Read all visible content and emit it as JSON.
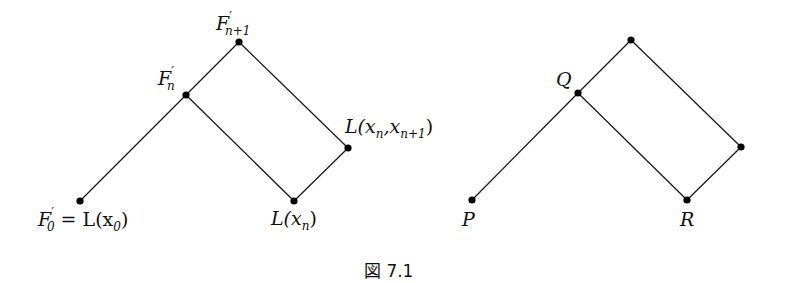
{
  "figure": {
    "caption": "図 7.1",
    "left_diagram": {
      "nodes": [
        {
          "id": "F0",
          "label_main": "F",
          "label_prime": "′",
          "label_sub": "0",
          "label_rest": " = L(x",
          "label_rest_sub": "0",
          "label_close": ")",
          "x": 80,
          "y": 201
        },
        {
          "id": "Fn",
          "label_main": "F",
          "label_prime": "′",
          "label_sub": "n",
          "x": 186,
          "y": 95
        },
        {
          "id": "Fn1",
          "label_main": "F",
          "label_prime": "′",
          "label_sub": "n+1",
          "x": 239,
          "y": 42
        },
        {
          "id": "Lxn",
          "label_main": "L(x",
          "label_sub": "n",
          "label_close": ")",
          "x": 294,
          "y": 201
        },
        {
          "id": "Lxnxn1",
          "label_main": "L(x",
          "label_sub": "n",
          "label_mid": ",x",
          "label_sub2": "n+1",
          "label_close": ")",
          "x": 348,
          "y": 148
        }
      ],
      "edges": [
        [
          "F0",
          "Fn"
        ],
        [
          "Fn",
          "Fn1"
        ],
        [
          "Fn",
          "Lxn"
        ],
        [
          "Fn1",
          "Lxnxn1"
        ],
        [
          "Lxn",
          "Lxnxn1"
        ]
      ]
    },
    "right_diagram": {
      "nodes": [
        {
          "id": "P",
          "label": "P",
          "x": 472,
          "y": 200
        },
        {
          "id": "Q",
          "label": "Q",
          "x": 578,
          "y": 93
        },
        {
          "id": "T",
          "label": "",
          "x": 631,
          "y": 40
        },
        {
          "id": "R",
          "label": "R",
          "x": 687,
          "y": 200
        },
        {
          "id": "S",
          "label": "",
          "x": 741,
          "y": 147
        }
      ],
      "edges": [
        [
          "P",
          "Q"
        ],
        [
          "Q",
          "T"
        ],
        [
          "Q",
          "R"
        ],
        [
          "T",
          "S"
        ],
        [
          "R",
          "S"
        ]
      ]
    }
  }
}
